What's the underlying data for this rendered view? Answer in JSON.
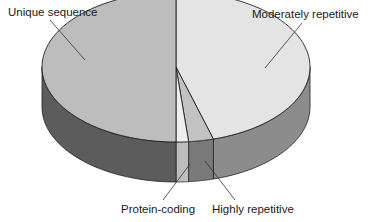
{
  "chart_data": {
    "type": "pie",
    "style": "3d",
    "title": "",
    "categories": [
      "Moderately repetitive",
      "Highly repetitive",
      "Protein-coding",
      "Unique sequence"
    ],
    "values": [
      45.5,
      3,
      1.5,
      50
    ],
    "unit": "percent (approx.)",
    "legend": "none (callout labels)",
    "slices": [
      {
        "label": "Moderately repetitive",
        "value": 45.5,
        "top_color": "#e4e4e4",
        "side_color": "#8c8c8c"
      },
      {
        "label": "Highly repetitive",
        "value": 3,
        "top_color": "#c2c2c2",
        "side_color": "#7a7a7a"
      },
      {
        "label": "Protein-coding",
        "value": 1.5,
        "top_color": "#efefef",
        "side_color": "#bdbdbd"
      },
      {
        "label": "Unique sequence",
        "value": 50,
        "top_color": "#bdbdbd",
        "side_color": "#5c5c5c"
      }
    ]
  },
  "labels": {
    "unique": "Unique sequence",
    "moderately": "Moderately repetitive",
    "protein": "Protein-coding",
    "highly": "Highly repetitive"
  }
}
